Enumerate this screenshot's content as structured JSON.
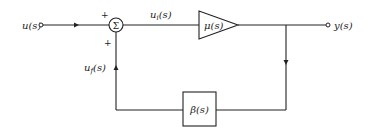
{
  "diagram": {
    "type": "feedback-block-diagram",
    "input": {
      "label": "u(s)"
    },
    "summing_junction": {
      "symbol": "Σ",
      "sign_input": "+",
      "sign_feedback": "+"
    },
    "forward_signal": {
      "label": "u_i(s)",
      "display": "ui(s)"
    },
    "amplifier": {
      "label": "μ(s)"
    },
    "output": {
      "label": "y(s)"
    },
    "feedback_block": {
      "label": "β(s)"
    },
    "feedback_signal": {
      "label": "u_f(s)",
      "display": "uf(s)"
    }
  },
  "colors": {
    "line": "#222222",
    "background": "#ffffff"
  }
}
